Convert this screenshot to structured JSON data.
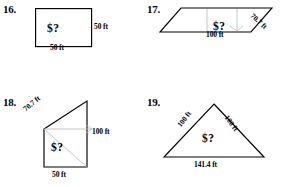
{
  "worksheet": {
    "problems": [
      {
        "number": "16.",
        "shape": "square",
        "interior_label": "$?",
        "labels": {
          "right": "50 ft",
          "bottom": "50 ft"
        }
      },
      {
        "number": "17.",
        "shape": "parallelogram",
        "interior_label": "$?",
        "labels": {
          "side": "70.7 ft",
          "bottom": "100 ft"
        }
      },
      {
        "number": "18.",
        "shape": "right-trapezoid",
        "interior_label": "$?",
        "labels": {
          "hypotenuse": "70.7 ft",
          "right": "100 ft",
          "bottom": "50 ft"
        }
      },
      {
        "number": "19.",
        "shape": "triangle",
        "interior_label": "$?",
        "labels": {
          "left": "100 ft",
          "right": "100 ft",
          "bottom": "141.4 ft"
        }
      }
    ]
  },
  "colors": {
    "ink": "#000000",
    "faint_guide": "#b9b9b9",
    "paper": "#ffffff"
  }
}
